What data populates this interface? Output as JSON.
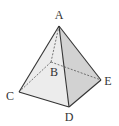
{
  "diagram": {
    "type": "square pyramid",
    "vertices": {
      "A": {
        "label": "A",
        "x": 59,
        "y": 26,
        "lx": 59,
        "ly": 19
      },
      "B": {
        "label": "B",
        "x": 51,
        "y": 62,
        "lx": 54,
        "ly": 76
      },
      "C": {
        "label": "C",
        "x": 19,
        "y": 92,
        "lx": 10,
        "ly": 100
      },
      "D": {
        "label": "D",
        "x": 69,
        "y": 107,
        "lx": 69,
        "ly": 121
      },
      "E": {
        "label": "E",
        "x": 101,
        "y": 80,
        "lx": 108,
        "ly": 85
      }
    },
    "visible_edges": [
      "AC",
      "AD",
      "AE",
      "CD",
      "DE"
    ],
    "hidden_edges": [
      "AB",
      "BC",
      "BE"
    ],
    "colors": {
      "edge": "#333333",
      "face_left": "#ececec",
      "face_right": "#d2d2d2",
      "background": "#ffffff"
    }
  }
}
